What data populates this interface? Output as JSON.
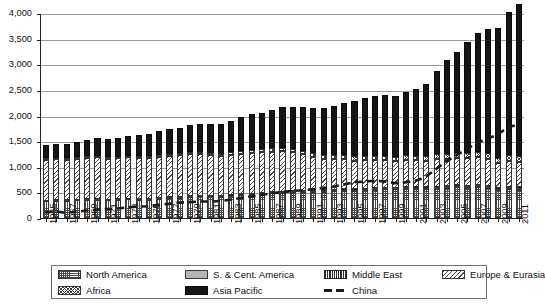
{
  "chart_data": {
    "type": "bar",
    "subtype": "stacked-bar-with-line-overlay",
    "title": "",
    "xlabel": "",
    "ylabel": "",
    "ylim": [
      0,
      4000
    ],
    "ytick_values": [
      0,
      500,
      1000,
      1500,
      2000,
      2500,
      3000,
      3500,
      4000
    ],
    "ytick_labels": [
      "0",
      "500",
      "1,000",
      "1,500",
      "2,000",
      "2,500",
      "3,000",
      "3,500",
      "4,000"
    ],
    "grid": true,
    "legend_position": "bottom",
    "x": [
      1965,
      1966,
      1967,
      1968,
      1969,
      1970,
      1971,
      1972,
      1973,
      1974,
      1975,
      1976,
      1977,
      1978,
      1979,
      1980,
      1981,
      1982,
      1983,
      1984,
      1985,
      1986,
      1987,
      1988,
      1989,
      1990,
      1991,
      1992,
      1993,
      1994,
      1995,
      1996,
      1997,
      1998,
      1999,
      2000,
      2001,
      2002,
      2003,
      2004,
      2005,
      2006,
      2007,
      2008,
      2009,
      2010,
      2011
    ],
    "xtick_labels": [
      "1965",
      "",
      "1967",
      "",
      "1969",
      "",
      "1971",
      "",
      "1973",
      "",
      "1975",
      "",
      "1977",
      "",
      "1979",
      "",
      "1981",
      "",
      "1983",
      "",
      "1985",
      "",
      "1987",
      "",
      "1989",
      "",
      "1991",
      "",
      "1993",
      "",
      "1995",
      "",
      "1997",
      "",
      "1999",
      "",
      "2001",
      "",
      "2003",
      "",
      "2005",
      "",
      "2007",
      "",
      "2009",
      "",
      "2011"
    ],
    "series": [
      {
        "name": "North America",
        "pattern": "dotted-hatch",
        "values": [
          330,
          340,
          335,
          350,
          355,
          360,
          350,
          355,
          365,
          360,
          360,
          380,
          390,
          400,
          415,
          420,
          420,
          410,
          425,
          450,
          460,
          470,
          480,
          495,
          500,
          510,
          505,
          515,
          525,
          535,
          530,
          545,
          555,
          565,
          560,
          580,
          570,
          565,
          580,
          590,
          600,
          595,
          605,
          590,
          540,
          565,
          555
        ]
      },
      {
        "name": "S. & Cent. America",
        "pattern": "solid-grey",
        "values": [
          8,
          8,
          8,
          9,
          9,
          9,
          9,
          10,
          10,
          10,
          10,
          11,
          11,
          11,
          12,
          12,
          12,
          12,
          13,
          14,
          15,
          16,
          17,
          18,
          18,
          19,
          19,
          20,
          20,
          21,
          21,
          22,
          22,
          23,
          23,
          24,
          24,
          25,
          26,
          27,
          28,
          29,
          30,
          31,
          30,
          33,
          34
        ]
      },
      {
        "name": "Middle East",
        "pattern": "vertical-lines",
        "values": [
          1,
          1,
          1,
          1,
          1,
          1,
          1,
          1,
          1,
          1,
          1,
          1,
          2,
          2,
          2,
          2,
          2,
          2,
          3,
          3,
          3,
          3,
          4,
          4,
          4,
          5,
          5,
          5,
          5,
          6,
          6,
          6,
          6,
          7,
          7,
          7,
          8,
          8,
          8,
          8,
          9,
          9,
          9,
          9,
          9,
          10,
          10
        ]
      },
      {
        "name": "Europe & Eurasia",
        "pattern": "diagonal-hatch",
        "values": [
          800,
          805,
          795,
          800,
          810,
          815,
          800,
          800,
          805,
          800,
          800,
          805,
          805,
          810,
          820,
          810,
          790,
          780,
          785,
          790,
          795,
          790,
          795,
          790,
          760,
          710,
          665,
          620,
          600,
          580,
          565,
          560,
          545,
          530,
          520,
          520,
          525,
          520,
          530,
          535,
          530,
          535,
          540,
          530,
          485,
          505,
          500
        ]
      },
      {
        "name": "Africa",
        "pattern": "cross-hatch",
        "values": [
          25,
          26,
          27,
          28,
          29,
          30,
          31,
          32,
          34,
          35,
          37,
          39,
          41,
          43,
          45,
          47,
          49,
          51,
          53,
          56,
          58,
          61,
          63,
          66,
          68,
          71,
          73,
          75,
          77,
          79,
          81,
          83,
          85,
          87,
          88,
          90,
          92,
          94,
          96,
          98,
          100,
          102,
          104,
          106,
          105,
          108,
          110
        ]
      },
      {
        "name": "Asia Pacific",
        "pattern": "solid-black",
        "values": [
          255,
          270,
          280,
          300,
          320,
          345,
          355,
          370,
          395,
          410,
          430,
          455,
          480,
          500,
          520,
          545,
          560,
          580,
          610,
          650,
          690,
          715,
          755,
          795,
          825,
          855,
          885,
          920,
          960,
          1020,
          1080,
          1120,
          1175,
          1180,
          1185,
          1230,
          1290,
          1400,
          1620,
          1820,
          1980,
          2160,
          2320,
          2430,
          2530,
          2790,
          2975
        ]
      }
    ],
    "overlay_line": {
      "name": "China",
      "style": "dashed",
      "color": "#1a1a1a",
      "values": [
        130,
        150,
        120,
        140,
        165,
        180,
        195,
        205,
        225,
        240,
        250,
        275,
        295,
        320,
        330,
        340,
        340,
        350,
        375,
        410,
        440,
        470,
        500,
        525,
        545,
        560,
        580,
        605,
        630,
        670,
        715,
        730,
        745,
        735,
        700,
        715,
        740,
        820,
        965,
        1120,
        1240,
        1360,
        1480,
        1570,
        1640,
        1790,
        1840
      ]
    }
  },
  "legend": {
    "items": [
      {
        "label": "North America",
        "pattern": "dotted-hatch"
      },
      {
        "label": "S. & Cent. America",
        "pattern": "solid-grey"
      },
      {
        "label": "Middle East",
        "pattern": "vertical-lines"
      },
      {
        "label": "Europe & Eurasia",
        "pattern": "diagonal-hatch"
      },
      {
        "label": "Africa",
        "pattern": "cross-hatch"
      },
      {
        "label": "Asia Pacific",
        "pattern": "solid-black"
      },
      {
        "label": "China",
        "pattern": "dashed-line"
      }
    ]
  }
}
